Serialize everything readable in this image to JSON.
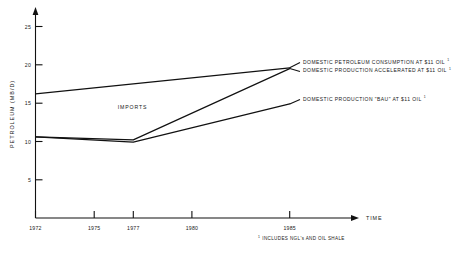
{
  "chart_data": {
    "type": "line",
    "title": "",
    "xlabel": "TIME",
    "ylabel": "PETROLEUM  (MB/D)",
    "x": [
      1972,
      1975,
      1977,
      1980,
      1985
    ],
    "xlim": [
      1972,
      1985
    ],
    "ylim": [
      0,
      25
    ],
    "yticks": [
      5,
      10,
      15,
      20,
      25
    ],
    "xticks": [
      1972,
      1975,
      1977,
      1980,
      1985
    ],
    "grid": false,
    "legend_position": "right-inline",
    "series": [
      {
        "name": "DOMESTIC PETROLEUM CONSUMPTION AT $11 OIL",
        "x": [
          1972,
          1985
        ],
        "values": [
          16.2,
          19.6
        ]
      },
      {
        "name": "DOMESTIC PRODUCTION ACCELERATED AT $11 OIL",
        "x": [
          1972,
          1977,
          1985
        ],
        "values": [
          10.6,
          10.2,
          19.5
        ]
      },
      {
        "name": "DOMESTIC PRODUCTION 'BAU' AT $11 OIL",
        "x": [
          1972,
          1977,
          1985
        ],
        "values": [
          10.6,
          9.9,
          14.9
        ]
      }
    ],
    "annotations": [
      {
        "text": "IMPORTS",
        "x": 1976.2,
        "y": 14.2
      }
    ]
  },
  "axes": {
    "y_title": "PETROLEUM  (MB/D)",
    "y_tick_labels": [
      "5",
      "10",
      "15",
      "20",
      "25"
    ],
    "x_tick_labels": [
      "1972",
      "1975",
      "1977",
      "1980",
      "1985"
    ],
    "x_axis_arrow_label": "TIME"
  },
  "annotations": {
    "imports": "IMPORTS"
  },
  "legend": {
    "items": [
      {
        "label": "DOMESTIC PETROLEUM CONSUMPTION AT $11 OIL",
        "superscript": "1"
      },
      {
        "label": "DOMESTIC PRODUCTION ACCELERATED AT $11 OIL",
        "superscript": "1"
      },
      {
        "label": "DOMESTIC PRODUCTION \"BAU\" AT $11 OIL",
        "superscript": "1"
      }
    ]
  },
  "footnote": {
    "marker": "1",
    "text": "INCLUDES NGL's AND OIL SHALE"
  },
  "colors": {
    "ink": "#1a1a1a",
    "line": "#111111",
    "background": "#ffffff"
  }
}
